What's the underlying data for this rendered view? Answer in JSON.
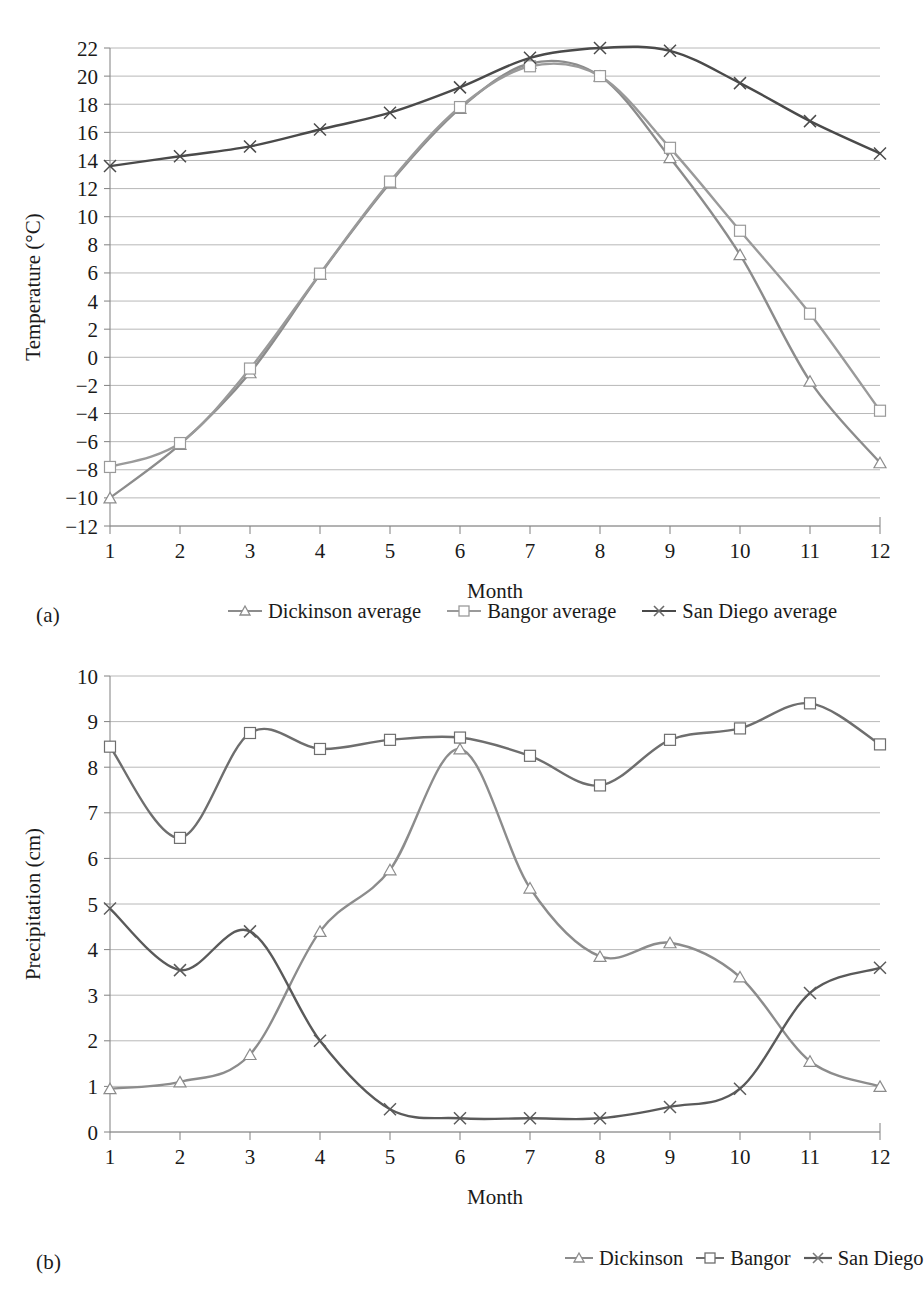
{
  "figure_a": {
    "panel_label": "(a)",
    "legend": [
      {
        "name": "Dickinson average",
        "marker": "triangle-marker-icon",
        "color": "#8c8c8c"
      },
      {
        "name": "Bangor average",
        "marker": "square-marker-icon",
        "color": "#9a9a9a"
      },
      {
        "name": "San Diego average",
        "marker": "cross-marker-icon",
        "color": "#4a4a4a"
      }
    ]
  },
  "figure_b": {
    "panel_label": "(b)",
    "legend": [
      {
        "name": "Dickinson",
        "marker": "triangle-marker-icon",
        "color": "#8c8c8c"
      },
      {
        "name": "Bangor",
        "marker": "square-marker-icon",
        "color": "#6e6e6e"
      },
      {
        "name": "San Diego",
        "marker": "cross-marker-icon",
        "color": "#5a5a5a"
      }
    ]
  },
  "chart_data": [
    {
      "type": "line",
      "id": "temperature-chart",
      "title": "",
      "xlabel": "Month",
      "ylabel": "Temperature (°C)",
      "x": [
        1,
        2,
        3,
        4,
        5,
        6,
        7,
        8,
        9,
        10,
        11,
        12
      ],
      "xtick_labels": [
        "1",
        "2",
        "3",
        "4",
        "5",
        "6",
        "7",
        "8",
        "9",
        "10",
        "11",
        "12"
      ],
      "ytick_labels": [
        "-12",
        "-10",
        "-8",
        "-6",
        "-4",
        "-2",
        "0",
        "2",
        "4",
        "6",
        "8",
        "10",
        "12",
        "14",
        "16",
        "18",
        "20",
        "22"
      ],
      "xlim": [
        1,
        12
      ],
      "ylim": [
        -12,
        22
      ],
      "ystep": 2,
      "grid": true,
      "legend_position": "below",
      "series": [
        {
          "name": "Dickinson average",
          "marker": "triangle",
          "color": "#8c8c8c",
          "values": [
            -10.0,
            -6.2,
            -1.1,
            5.9,
            12.4,
            17.7,
            20.9,
            20.0,
            14.2,
            7.3,
            -1.7,
            -7.5
          ]
        },
        {
          "name": "Bangor average",
          "marker": "square",
          "color": "#9a9a9a",
          "values": [
            -7.8,
            -6.1,
            -0.8,
            5.95,
            12.5,
            17.8,
            20.7,
            20.0,
            14.9,
            9.0,
            3.1,
            -3.8
          ]
        },
        {
          "name": "San Diego average",
          "marker": "cross",
          "color": "#4a4a4a",
          "values": [
            13.6,
            14.3,
            15.0,
            16.2,
            17.4,
            19.2,
            21.3,
            22.0,
            21.8,
            19.5,
            16.8,
            14.5
          ]
        }
      ]
    },
    {
      "type": "line",
      "id": "precipitation-chart",
      "title": "",
      "xlabel": "Month",
      "ylabel": "Precipitation (cm)",
      "x": [
        1,
        2,
        3,
        4,
        5,
        6,
        7,
        8,
        9,
        10,
        11,
        12
      ],
      "xtick_labels": [
        "1",
        "2",
        "3",
        "4",
        "5",
        "6",
        "7",
        "8",
        "9",
        "10",
        "11",
        "12"
      ],
      "ytick_labels": [
        "0",
        "1",
        "2",
        "3",
        "4",
        "5",
        "6",
        "7",
        "8",
        "9",
        "10"
      ],
      "xlim": [
        1,
        12
      ],
      "ylim": [
        0,
        10
      ],
      "ystep": 1,
      "grid": true,
      "legend_position": "below",
      "series": [
        {
          "name": "Dickinson",
          "marker": "triangle",
          "color": "#8c8c8c",
          "values": [
            0.95,
            1.1,
            1.7,
            4.4,
            5.75,
            8.4,
            5.35,
            3.85,
            4.15,
            3.4,
            1.55,
            1.0
          ]
        },
        {
          "name": "Bangor",
          "marker": "square",
          "color": "#6e6e6e",
          "values": [
            8.45,
            6.45,
            8.75,
            8.4,
            8.6,
            8.65,
            8.25,
            7.6,
            8.6,
            8.85,
            9.4,
            8.5
          ]
        },
        {
          "name": "San Diego",
          "marker": "cross",
          "color": "#5a5a5a",
          "values": [
            4.9,
            3.55,
            4.4,
            2.0,
            0.5,
            0.3,
            0.3,
            0.3,
            0.55,
            0.95,
            3.05,
            3.6
          ]
        }
      ]
    }
  ]
}
